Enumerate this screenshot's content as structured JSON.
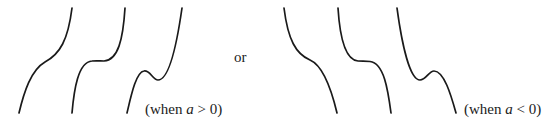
{
  "diagram": {
    "connector_text": "or",
    "groups": [
      {
        "id": "positive",
        "label_prefix": "(when ",
        "label_var": "a",
        "label_suffix": " > 0)",
        "curves": [
          {
            "shape": "increasing, inflection, no turning points"
          },
          {
            "shape": "increasing, horizontal inflection (plateau)"
          },
          {
            "shape": "local maximum then local minimum"
          }
        ]
      },
      {
        "id": "negative",
        "label_prefix": "(when ",
        "label_var": "a",
        "label_suffix": " < 0)",
        "curves": [
          {
            "shape": "decreasing, inflection, no turning points"
          },
          {
            "shape": "decreasing, horizontal inflection (plateau)"
          },
          {
            "shape": "local minimum then local maximum"
          }
        ]
      }
    ],
    "colors": {
      "stroke": "#1a1a1a",
      "text": "#222222",
      "background": "#ffffff"
    }
  }
}
